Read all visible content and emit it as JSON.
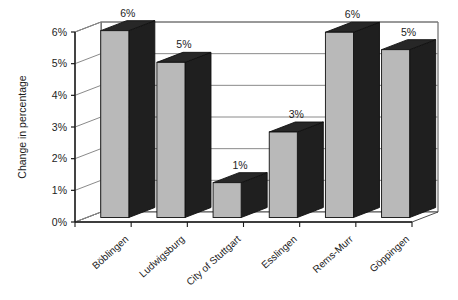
{
  "chart_data": {
    "type": "bar",
    "title": "",
    "subtitle": "",
    "xlabel": "",
    "ylabel": "Change in percentage",
    "categories": [
      "Böblingen",
      "Ludwigsburg",
      "City of Stuttgart",
      "Esslingen",
      "Rems-Murr",
      "Göppingen"
    ],
    "values": [
      5.9,
      4.9,
      1.1,
      2.7,
      5.85,
      5.3
    ],
    "data_labels": [
      "6%",
      "5%",
      "1%",
      "3%",
      "6%",
      "5%"
    ],
    "ylim": [
      0,
      6
    ],
    "ytick_values": [
      0,
      1,
      2,
      3,
      4,
      5,
      6
    ],
    "ytick_labels": [
      "0%",
      "1%",
      "2%",
      "3%",
      "4%",
      "5%",
      "6%"
    ],
    "grid": true,
    "grid_axis": "y",
    "legend": false,
    "legend_position": "none",
    "three_d": true,
    "series": [
      {
        "name": "Change in percentage",
        "values": [
          5.9,
          4.9,
          1.1,
          2.7,
          5.85,
          5.3
        ]
      }
    ]
  },
  "style": {
    "bar_front_color": "#b9b9b9",
    "bar_top_color": "#272727",
    "bar_side_color": "#1f1f1f",
    "bar_outline_color": "#111111",
    "wall_color": "#ffffff",
    "wall_line_color": "#5a5a5a",
    "grid_line_color": "#8a8a8a",
    "axis_line_color": "#1a1a1a",
    "background_color": "#ffffff",
    "text_color": "#1c1c1c"
  }
}
